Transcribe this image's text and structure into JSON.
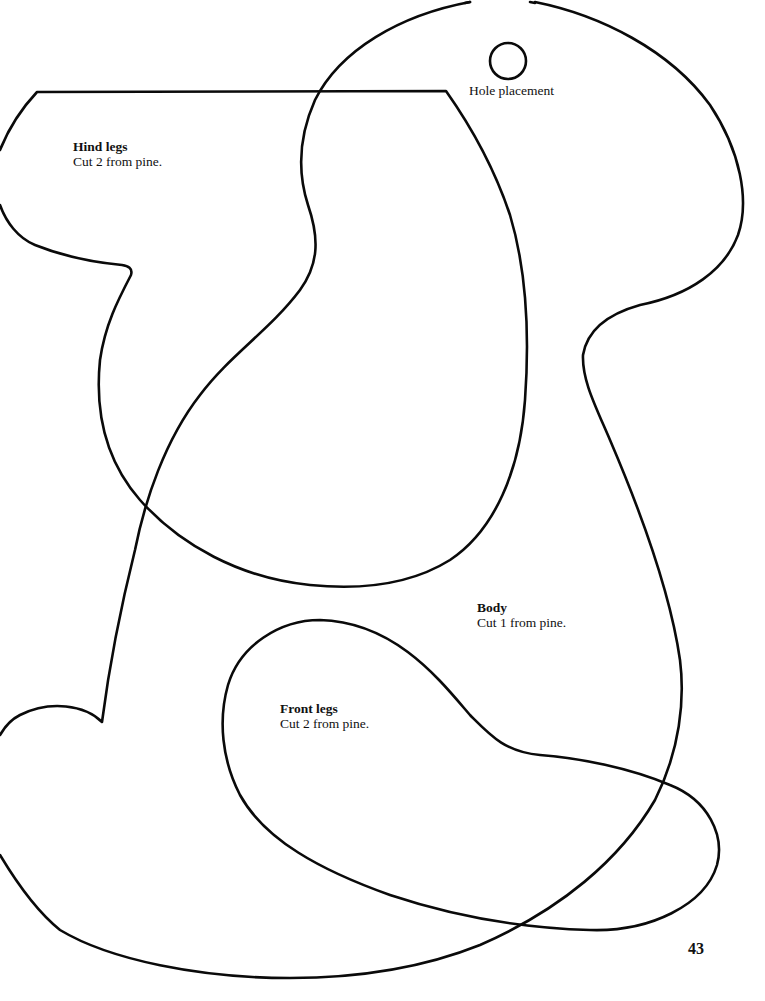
{
  "document": {
    "type": "woodworking pattern page",
    "page_number": "43"
  },
  "pieces": [
    {
      "id": "hind-legs",
      "title": "Hind legs",
      "instruction": "Cut 2 from pine."
    },
    {
      "id": "body",
      "title": "Body",
      "instruction": "Cut 1 from pine."
    },
    {
      "id": "front-legs",
      "title": "Front legs",
      "instruction": "Cut 2 from pine."
    }
  ],
  "hole": {
    "label": "Hole placement",
    "icon": "circle-outline"
  },
  "colors": {
    "line": "#0a0a0a",
    "background": "#ffffff"
  }
}
